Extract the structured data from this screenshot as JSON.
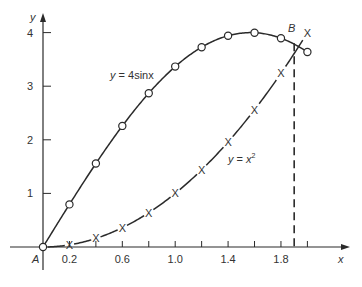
{
  "chart_data": {
    "type": "line",
    "title": "",
    "xlabel": "x",
    "ylabel": "y",
    "xlim": [
      0,
      2.1
    ],
    "ylim": [
      0,
      4.2
    ],
    "grid": false,
    "x_ticks": [
      0.2,
      0.4,
      0.6,
      0.8,
      1.0,
      1.2,
      1.4,
      1.6,
      1.8,
      2.0
    ],
    "x_tick_labels": [
      "0.2",
      "",
      "0.6",
      "",
      "1.0",
      "",
      "1.4",
      "",
      "1.8",
      ""
    ],
    "y_ticks": [
      1,
      2,
      3,
      4
    ],
    "y_tick_labels": [
      "1",
      "2",
      "3",
      "4"
    ],
    "x": [
      0,
      0.2,
      0.4,
      0.6,
      0.8,
      1.0,
      1.2,
      1.4,
      1.6,
      1.8,
      2.0
    ],
    "series": [
      {
        "name": "y = 4sinx",
        "marker": "circle",
        "line": "solid",
        "values": [
          0,
          0.795,
          1.558,
          2.259,
          2.869,
          3.366,
          3.728,
          3.942,
          3.998,
          3.895,
          3.637
        ]
      },
      {
        "name": "y = x²",
        "marker": "x",
        "line": "solid-broken-at-markers",
        "values": [
          0,
          0.04,
          0.16,
          0.36,
          0.64,
          1.0,
          1.44,
          1.96,
          2.56,
          3.24,
          4.0
        ]
      }
    ],
    "annotations": [
      {
        "label": "A",
        "x": 0,
        "y": 0,
        "note": "origin / start point"
      },
      {
        "label": "B",
        "x": 1.9,
        "y": 3.8,
        "note": "intersection of curves"
      },
      {
        "label": "dashed vertical line",
        "x": 1.9,
        "from_y": 0,
        "to_y": 3.8
      }
    ]
  },
  "labels": {
    "y_axis": "y",
    "x_axis": "x",
    "point_a": "A",
    "point_b": "B",
    "eq_sin": "y = 4sinx",
    "eq_sq_base": "y = x",
    "eq_sq_exp": "2",
    "x_marker_glyph": "X"
  }
}
